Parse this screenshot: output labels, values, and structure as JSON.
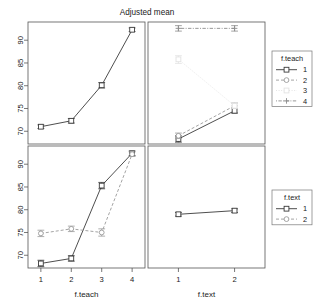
{
  "chart_data": {
    "type": "line",
    "title": "Adjusted mean",
    "layout": "2x2 panel interaction plot, error bars shown",
    "grid": false,
    "ylim": [
      67.2,
      94.0
    ],
    "yticks": [
      70,
      75,
      80,
      85,
      90
    ],
    "panels": [
      {
        "id": "top-left",
        "row": 0,
        "col": 0,
        "xlabel": "f.teach",
        "categories": [
          "1",
          "2",
          "3",
          "4"
        ],
        "legend": null,
        "series": [
          {
            "name": "overall",
            "style": "solid",
            "marker": "square",
            "color": "#3a3a3a",
            "values": [
              71.0,
              72.3,
              80.1,
              92.3
            ],
            "err_low": [
              70.6,
              71.8,
              79.5,
              91.9
            ],
            "err_high": [
              71.4,
              72.8,
              80.7,
              92.7
            ]
          }
        ]
      },
      {
        "id": "top-right",
        "row": 0,
        "col": 1,
        "xlabel": "f.text",
        "categories": [
          "1",
          "2"
        ],
        "legend": {
          "title": "f.teach",
          "position": "right"
        },
        "series": [
          {
            "name": "1",
            "style": "solid",
            "marker": "square",
            "color": "#3a3a3a",
            "values": [
              68.3,
              74.5
            ],
            "err_low": [
              67.6,
              74.0
            ],
            "err_high": [
              69.0,
              75.0
            ]
          },
          {
            "name": "2",
            "style": "dashed",
            "marker": "circle",
            "color": "#9a9a9a",
            "values": [
              69.0,
              75.6
            ],
            "err_low": [
              68.4,
              75.0
            ],
            "err_high": [
              69.6,
              76.2
            ]
          },
          {
            "name": "3",
            "style": "dotted",
            "marker": "square",
            "color": "#e2e2e2",
            "values": [
              85.8,
              75.6
            ],
            "err_low": [
              84.9,
              75.0
            ],
            "err_high": [
              86.6,
              76.2
            ]
          },
          {
            "name": "4",
            "style": "dotdash",
            "marker": "plus",
            "color": "#8c8c8c",
            "values": [
              92.6,
              92.6
            ],
            "err_low": [
              92.0,
              92.0
            ],
            "err_high": [
              93.2,
              93.2
            ]
          }
        ]
      },
      {
        "id": "bottom-left",
        "row": 1,
        "col": 0,
        "xlabel": "f.teach",
        "categories": [
          "1",
          "2",
          "3",
          "4"
        ],
        "legend": null,
        "series": [
          {
            "name": "1",
            "style": "solid",
            "marker": "square",
            "color": "#3a3a3a",
            "values": [
              68.2,
              69.3,
              85.3,
              92.4
            ],
            "err_low": [
              67.5,
              68.7,
              84.6,
              91.9
            ],
            "err_high": [
              68.9,
              69.9,
              86.0,
              92.9
            ]
          },
          {
            "name": "2",
            "style": "dashed",
            "marker": "circle",
            "color": "#9a9a9a",
            "values": [
              74.8,
              75.8,
              75.0,
              92.2
            ],
            "err_low": [
              74.1,
              75.2,
              74.2,
              91.7
            ],
            "err_high": [
              75.5,
              76.4,
              75.8,
              92.7
            ]
          }
        ]
      },
      {
        "id": "bottom-right",
        "row": 1,
        "col": 1,
        "xlabel": "f.text",
        "categories": [
          "1",
          "2"
        ],
        "legend": {
          "title": "f.text",
          "position": "right"
        },
        "series": [
          {
            "name": "1",
            "style": "solid",
            "marker": "square",
            "color": "#3a3a3a",
            "values": [
              79.0,
              79.8
            ],
            "err_low": [
              78.6,
              79.4
            ],
            "err_high": [
              79.4,
              80.2
            ]
          }
        ]
      }
    ],
    "legends": [
      {
        "id": "legend-f-teach",
        "title": "f.teach",
        "entries": [
          {
            "label": "1",
            "style": "solid",
            "marker": "square",
            "color": "#3a3a3a"
          },
          {
            "label": "2",
            "style": "dashed",
            "marker": "circle",
            "color": "#9a9a9a"
          },
          {
            "label": "3",
            "style": "dotted",
            "marker": "square",
            "color": "#e2e2e2"
          },
          {
            "label": "4",
            "style": "dotdash",
            "marker": "plus",
            "color": "#8c8c8c"
          }
        ]
      },
      {
        "id": "legend-f-text",
        "title": "f.text",
        "entries": [
          {
            "label": "1",
            "style": "solid",
            "marker": "square",
            "color": "#3a3a3a"
          },
          {
            "label": "2",
            "style": "dashed",
            "marker": "circle",
            "color": "#9a9a9a"
          }
        ]
      }
    ]
  },
  "axes": {
    "ytick_labels": [
      "70",
      "75",
      "80",
      "85",
      "90"
    ],
    "xtick_labels_teach": [
      "1",
      "2",
      "3",
      "4"
    ],
    "xtick_labels_text": [
      "1",
      "2"
    ],
    "xlabel_left": "f.teach",
    "xlabel_right": "f.text"
  },
  "title": "Adjusted mean"
}
